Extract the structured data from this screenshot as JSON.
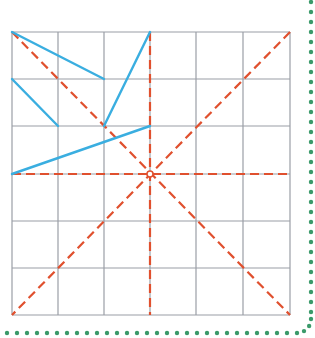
{
  "diagram": {
    "type": "grid-with-line-segments",
    "grid": {
      "rows": 6,
      "cols": 6,
      "x_lines": [
        12,
        58,
        104,
        150,
        196,
        243,
        290
      ],
      "y_lines": [
        32,
        79,
        126,
        174,
        221,
        268,
        315
      ],
      "line_color": "#9a9ea6"
    },
    "red_dashed_lines": {
      "color": "#e0502e",
      "lines": [
        {
          "name": "diagonal-main",
          "x1": 12,
          "y1": 32,
          "x2": 290,
          "y2": 315
        },
        {
          "name": "diagonal-anti",
          "x1": 290,
          "y1": 32,
          "x2": 12,
          "y2": 315
        },
        {
          "name": "vertical-center",
          "x1": 150,
          "y1": 32,
          "x2": 150,
          "y2": 315
        },
        {
          "name": "horizontal-center",
          "x1": 12,
          "y1": 174,
          "x2": 290,
          "y2": 174
        }
      ]
    },
    "blue_segments": {
      "color": "#3aaee0",
      "lines": [
        {
          "x1": 12,
          "y1": 32,
          "x2": 104,
          "y2": 79
        },
        {
          "x1": 12,
          "y1": 79,
          "x2": 58,
          "y2": 126
        },
        {
          "x1": 150,
          "y1": 32,
          "x2": 104,
          "y2": 126
        },
        {
          "x1": 12,
          "y1": 174,
          "x2": 150,
          "y2": 126
        }
      ]
    },
    "center_point": {
      "x": 150,
      "y": 174
    },
    "dotted_border": {
      "color": "#3a9a6a",
      "right_x": 311,
      "bottom_y": 333,
      "dot_spacing": 10
    }
  }
}
